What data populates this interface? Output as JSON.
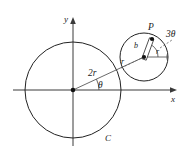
{
  "figure": {
    "axes": {
      "y_label": "y",
      "x_label": "x"
    },
    "labels": {
      "point_p": "P",
      "big_radius": "2r",
      "theta": "θ",
      "three_theta": "3θ",
      "small_radius_outer": "r",
      "small_radius_inner": "r",
      "offset_b": "b",
      "fixed_circle": "C"
    },
    "geometry": {
      "origin": {
        "x": 73,
        "y": 90
      },
      "big_circle_radius": 48,
      "small_circle_center": {
        "x": 144,
        "y": 57
      },
      "small_circle_radius": 24,
      "point_p": {
        "x": 152,
        "y": 40
      },
      "line_angle_deg": -25
    },
    "colors": {
      "stroke": "#222222",
      "axis": "#3a3a3a",
      "text": "#1a1a1a",
      "background": "#ffffff"
    }
  }
}
